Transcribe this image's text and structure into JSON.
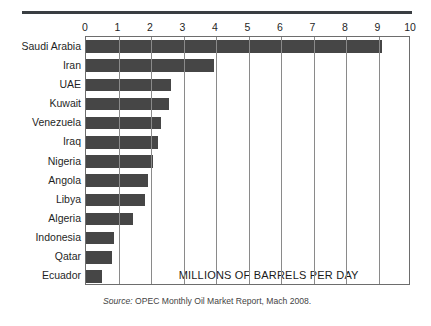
{
  "chart_data": {
    "type": "bar",
    "orientation": "horizontal",
    "title": "",
    "subtitle": "",
    "xlabel": "MILLIONS OF BARRELS PER DAY",
    "ylabel": "",
    "xlim": [
      0,
      10
    ],
    "xticks": [
      0,
      1,
      2,
      3,
      4,
      5,
      6,
      7,
      8,
      9,
      10
    ],
    "xtick_labels": [
      "0",
      "1",
      "2",
      "3",
      "4",
      "5",
      "6",
      "7",
      "8",
      "9",
      "10"
    ],
    "grid": "vertical",
    "legend": null,
    "categories": [
      "Saudi Arabia",
      "Iran",
      "UAE",
      "Kuwait",
      "Venezuela",
      "Iraq",
      "Nigeria",
      "Angola",
      "Libya",
      "Algeria",
      "Indonesia",
      "Qatar",
      "Ecuador"
    ],
    "values": [
      9.1,
      3.95,
      2.6,
      2.55,
      2.3,
      2.2,
      2.05,
      1.9,
      1.8,
      1.45,
      0.87,
      0.8,
      0.5
    ],
    "bar_color": "#464646",
    "annotations": [
      {
        "name": "units-annotation",
        "text": "MILLIONS OF BARRELS PER DAY"
      }
    ]
  },
  "caption": {
    "source_word": "Source:",
    "source_text": " OPEC Monthly Oil Market Report, Mach 2008."
  }
}
